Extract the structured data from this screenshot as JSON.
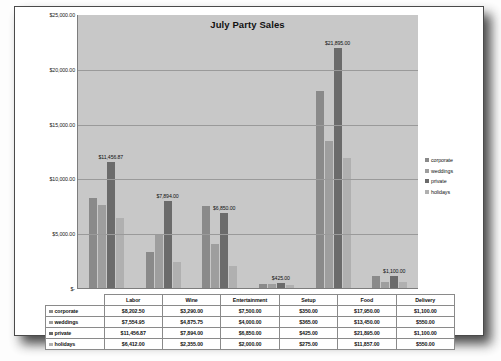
{
  "chart_data": {
    "type": "bar",
    "title": "July Party Sales",
    "xlabel": "",
    "ylabel": "",
    "ylim": [
      0,
      25000
    ],
    "grid": true,
    "legend_position": "right",
    "categories": [
      "Labor",
      "Wine",
      "Entertainment",
      "Setup",
      "Food",
      "Delivery"
    ],
    "ytick_labels": [
      "$25,000.00",
      "$20,000.00",
      "$15,000.00",
      "$10,000.00",
      "$5,000.00",
      "$-"
    ],
    "ytick_values": [
      25000,
      20000,
      15000,
      10000,
      5000,
      0
    ],
    "series": [
      {
        "name": "corporate",
        "color": "#8a8a8a",
        "values": [
          8202.5,
          3290.0,
          7500.0,
          350.0,
          17950.0,
          1100.0
        ],
        "labels": [
          "$8,202.50",
          "$3,290.00",
          "$7,500.00",
          "$350.00",
          "$17,950.00",
          "$1,100.00"
        ]
      },
      {
        "name": "weddings",
        "color": "#9e9e9e",
        "values": [
          7554.95,
          4875.75,
          4000.0,
          365.0,
          13450.0,
          550.0
        ],
        "labels": [
          "$7,554.95",
          "$4,875.75",
          "$4,000.00",
          "$365.00",
          "$13,450.00",
          "$550.00"
        ]
      },
      {
        "name": "private",
        "color": "#6b6b6b",
        "values": [
          11456.87,
          7894.0,
          6850.0,
          425.0,
          21895.0,
          1100.0
        ],
        "labels": [
          "$11,456.87",
          "$7,894.00",
          "$6,850.00",
          "$425.00",
          "$21,895.00",
          "$1,100.00"
        ]
      },
      {
        "name": "holidays",
        "color": "#b0b0b0",
        "values": [
          6412.0,
          2355.0,
          2000.0,
          275.0,
          11857.0,
          550.0
        ],
        "labels": [
          "$6,412.00",
          "$2,355.00",
          "$2,000.00",
          "$275.00",
          "$11,857.00",
          "$550.00"
        ]
      }
    ],
    "point_labels": [
      {
        "category": "Labor",
        "series": "private",
        "text": "$11,456.87"
      },
      {
        "category": "Wine",
        "series": "private",
        "text": "$7,894.00"
      },
      {
        "category": "Entertainment",
        "series": "private",
        "text": "$6,850.00"
      },
      {
        "category": "Setup",
        "series": "private",
        "text": "$425.00"
      },
      {
        "category": "Food",
        "series": "private",
        "text": "$21,895.00"
      },
      {
        "category": "Delivery",
        "series": "private",
        "text": "$1,100.00"
      }
    ]
  },
  "legend": {
    "items": [
      {
        "label": "corporate",
        "color": "#8a8a8a"
      },
      {
        "label": "weddings",
        "color": "#9e9e9e"
      },
      {
        "label": "private",
        "color": "#6b6b6b"
      },
      {
        "label": "holidays",
        "color": "#b0b0b0"
      }
    ]
  },
  "table": {
    "column_headers": [
      "Labor",
      "Wine",
      "Entertainment",
      "Setup",
      "Food",
      "Delivery"
    ],
    "rows": [
      {
        "label": "corporate",
        "color": "#8a8a8a",
        "cells": [
          "$8,202.50",
          "$3,290.00",
          "$7,500.00",
          "$350.00",
          "$17,950.00",
          "$1,100.00"
        ]
      },
      {
        "label": "weddings",
        "color": "#9e9e9e",
        "cells": [
          "$7,554.95",
          "$4,875.75",
          "$4,000.00",
          "$365.00",
          "$13,450.00",
          "$550.00"
        ]
      },
      {
        "label": "private",
        "color": "#6b6b6b",
        "cells": [
          "$11,456.87",
          "$7,894.00",
          "$6,850.00",
          "$425.00",
          "$21,895.00",
          "$1,100.00"
        ]
      },
      {
        "label": "holidays",
        "color": "#b0b0b0",
        "cells": [
          "$6,412.00",
          "$2,355.00",
          "$2,000.00",
          "$275.00",
          "$11,857.00",
          "$550.00"
        ]
      }
    ]
  }
}
